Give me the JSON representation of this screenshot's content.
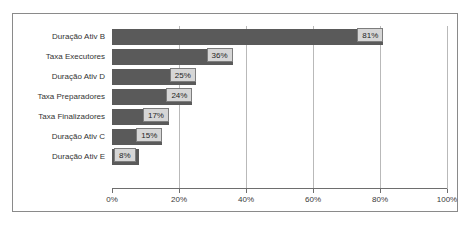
{
  "chart_data": {
    "type": "bar",
    "orientation": "horizontal",
    "title": "",
    "xlabel": "",
    "ylabel": "",
    "xlim": [
      0,
      100
    ],
    "grid": true,
    "legend": false,
    "xticks": [
      "0%",
      "20%",
      "40%",
      "60%",
      "80%",
      "100%"
    ],
    "xtick_values": [
      0,
      20,
      40,
      60,
      80,
      100
    ],
    "categories": [
      "Duração Ativ B",
      "Taxa Executores",
      "Duração Ativ D",
      "Taxa Preparadores",
      "Taxa Finalizadores",
      "Duração Ativ C",
      "Duração Ativ E"
    ],
    "values": [
      81,
      36,
      25,
      24,
      17,
      15,
      8
    ],
    "value_labels": [
      "81%",
      "36%",
      "25%",
      "24%",
      "17%",
      "15%",
      "8%"
    ],
    "colors": {
      "bar": "#5a5a5a",
      "label_box_fill": "#d6d6d6",
      "label_box_border": "#7d7d7d",
      "gridline": "#b9b9b9",
      "axis": "#6e6e6e",
      "frame": "#8a8a8a",
      "background": "#ffffff",
      "text": "#333333"
    }
  }
}
